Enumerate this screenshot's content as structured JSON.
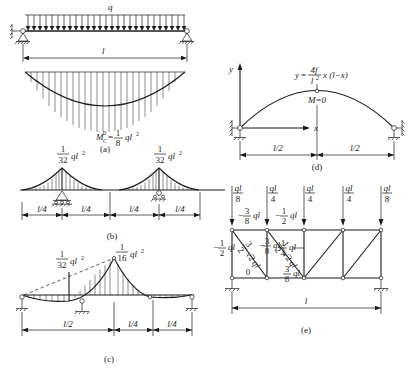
{
  "figure": {
    "line_color": "#1a1a1a",
    "background": "#ffffff"
  },
  "panel_a": {
    "caption": "(a)",
    "load_label": "q",
    "span_label": "l",
    "moment_label": {
      "symbol": "M",
      "sub": "C",
      "sup": "0",
      "equals": "=",
      "num": "1",
      "den": "8",
      "term": "ql",
      "term_sup": "2"
    }
  },
  "panel_b": {
    "caption": "(b)",
    "peak_left": {
      "num": "1",
      "den": "32",
      "term": "ql",
      "term_sup": "2"
    },
    "peak_right": {
      "num": "1",
      "den": "32",
      "term": "ql",
      "term_sup": "2"
    },
    "dims": [
      "l/4",
      "l/4",
      "l/4",
      "l/4"
    ]
  },
  "panel_c": {
    "caption": "(c)",
    "peak_small": {
      "num": "1",
      "den": "32",
      "term": "ql",
      "term_sup": "2"
    },
    "peak_large": {
      "num": "1",
      "den": "16",
      "term": "ql",
      "term_sup": "2"
    },
    "dims": [
      "l/2",
      "l/4",
      "l/4"
    ]
  },
  "panel_d": {
    "caption": "(d)",
    "axis_y": "y",
    "axis_x": "x",
    "equation": {
      "lhs": "y",
      "equals": "=",
      "num": "4f",
      "den": "l",
      "den_sup": "2",
      "rest": "x (l−x)"
    },
    "moment_zero": "M=0",
    "dims": [
      "l/2",
      "l/2"
    ]
  },
  "panel_e": {
    "caption": "(e)",
    "span_label": "l",
    "loads": [
      {
        "num": "ql",
        "den": "8"
      },
      {
        "num": "ql",
        "den": "4"
      },
      {
        "num": "ql",
        "den": "4"
      },
      {
        "num": "ql",
        "den": "4"
      },
      {
        "num": "ql",
        "den": "8"
      }
    ],
    "top_chord": [
      {
        "sign": "−",
        "num": "3",
        "den": "8",
        "term": "ql"
      },
      {
        "sign": "−",
        "num": "1",
        "den": "2",
        "term": "ql"
      }
    ],
    "bottom_chord": [
      {
        "text": "0"
      },
      {
        "sign": "",
        "num": "3",
        "den": "8",
        "term": "ql"
      }
    ],
    "left_vertical": {
      "sign": "−",
      "num": "1",
      "den": "2",
      "term": "ql"
    },
    "mid_vertical": {
      "sign": "",
      "num": "1",
      "den": "4",
      "term": "ql"
    },
    "diagonals": [
      {
        "coef": "3",
        "coef_den": "2",
        "radical": "√2",
        "term": "ql"
      },
      {
        "sign": "−",
        "num": "3",
        "den": "8",
        "term": "ql"
      },
      {
        "coef": "1",
        "coef_den": "2",
        "radical": "√2",
        "term": "ql"
      }
    ]
  }
}
